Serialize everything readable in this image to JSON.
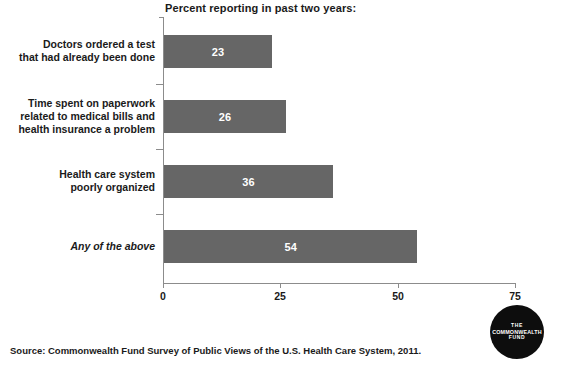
{
  "chart_data": {
    "type": "bar",
    "orientation": "horizontal",
    "title": "Percent reporting in past two years:",
    "xlabel": "",
    "ylabel": "",
    "xlim": [
      0,
      75
    ],
    "grid": false,
    "legend": null,
    "bar_color": "#666666",
    "value_label_color": "#ffffff",
    "axis_color": "#8c8c8c",
    "categories": [
      "Doctors ordered a test that had already been done",
      "Time spent on paperwork related to medical bills and health insurance a problem",
      "Health care system poorly organized",
      "Any of the above"
    ],
    "values": [
      23,
      26,
      36,
      54
    ],
    "xticks": [
      0,
      25,
      50,
      75
    ],
    "xtick_labels": [
      "0",
      "25",
      "50",
      "75"
    ]
  },
  "chart": {
    "title": "Percent reporting in past two years:",
    "bars": [
      {
        "label_line1": "Doctors ordered a test",
        "label_line2": "that had already been done",
        "label_line3": "",
        "value": 23,
        "value_text": "23",
        "italic": false
      },
      {
        "label_line1": "Time spent on paperwork",
        "label_line2": "related to medical bills and",
        "label_line3": "health insurance a problem",
        "value": 26,
        "value_text": "26",
        "italic": false
      },
      {
        "label_line1": "Health care system",
        "label_line2": "poorly organized",
        "label_line3": "",
        "value": 36,
        "value_text": "36",
        "italic": false
      },
      {
        "label_line1": "Any of the above",
        "label_line2": "",
        "label_line3": "",
        "value": 54,
        "value_text": "54",
        "italic": true
      }
    ],
    "xaxis": {
      "tick_labels": [
        "0",
        "25",
        "50",
        "75"
      ]
    }
  },
  "source": {
    "text": "Source: Commonwealth Fund Survey of Public Views of the U.S. Health Care System, 2011."
  },
  "logo": {
    "line1": "THE",
    "line2": "COMMONWEALTH",
    "line3": "FUND"
  }
}
